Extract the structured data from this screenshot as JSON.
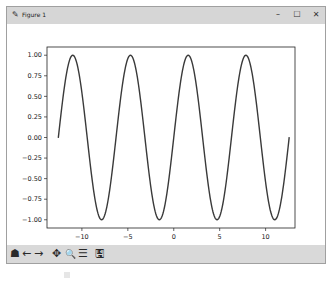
{
  "window": {
    "title": "Figure 1",
    "title_icon": "pen-icon",
    "controls": {
      "minimize": "–",
      "maximize": "☐",
      "close": "✕"
    }
  },
  "toolbar": {
    "home": "☗",
    "back": "←",
    "forward": "→",
    "pan": "✥",
    "zoom": "🔍",
    "configure": "☰",
    "save": "🖫"
  },
  "chart_data": {
    "type": "line",
    "title": "",
    "xlabel": "",
    "ylabel": "",
    "function": "sin(x)",
    "x_range": [
      -12.57,
      12.57
    ],
    "xlim": [
      -13.8,
      13.2
    ],
    "ylim": [
      -1.1,
      1.1
    ],
    "xticks": [
      -10,
      -5,
      0,
      5,
      10
    ],
    "xtick_labels": [
      "−10",
      "−5",
      "0",
      "5",
      "10"
    ],
    "yticks": [
      1.0,
      0.75,
      0.5,
      0.25,
      0.0,
      -0.25,
      -0.5,
      -0.75,
      -1.0
    ],
    "ytick_labels": [
      "1.00",
      "0.75",
      "0.50",
      "0.25",
      "0.00",
      "−0.25",
      "−0.50",
      "−0.75",
      "−1.00"
    ],
    "grid": false,
    "legend": null,
    "series": [
      {
        "name": "sin(x)",
        "color": "#3a3a3a",
        "x": [
          -12.57,
          -10.99,
          -9.42,
          -7.85,
          -6.28,
          -4.71,
          -3.14,
          -1.57,
          0,
          1.57,
          3.14,
          4.71,
          6.28,
          7.85,
          9.42,
          10.99,
          12.57
        ],
        "values": [
          0,
          1,
          0,
          -1,
          0,
          1,
          0,
          -1,
          0,
          1,
          0,
          -1,
          0,
          1,
          0,
          -1,
          0
        ]
      }
    ]
  }
}
